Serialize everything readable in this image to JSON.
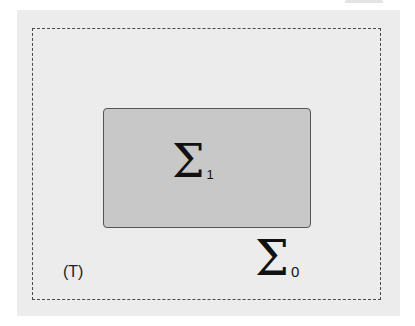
{
  "diagram": {
    "outer_region": {
      "style": "dashed",
      "label_symbol": "Σ",
      "label_subscript": "0"
    },
    "inner_region": {
      "style": "solid-filled",
      "label_symbol": "Σ",
      "label_subscript": "1"
    },
    "corner_label": "(T)"
  },
  "colors": {
    "canvas_bg": "#ececec",
    "inner_fill": "#c8c8c8",
    "border": "#555555",
    "text": "#111111"
  }
}
